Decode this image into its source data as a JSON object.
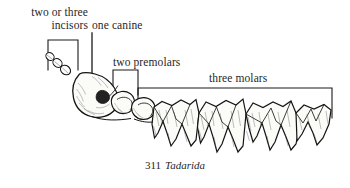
{
  "figure": {
    "caption_number": "311",
    "caption_species": "Tadarida",
    "background_color": "#ffffff",
    "ink_color": "#1a1a1a"
  },
  "labels": {
    "incisors": "two or three incisors",
    "incisors_line1": "two or three",
    "incisors_line2": "incisors",
    "canine": "one canine",
    "premolars": "two premolars",
    "molars": "three molars"
  },
  "brackets": [
    {
      "name": "incisors-bracket",
      "type": "u-bracket",
      "x1": 48,
      "x2": 78,
      "top_y": 40,
      "leg_bottom_y": 70
    },
    {
      "name": "canine-leader",
      "type": "vertical-line",
      "x": 92,
      "top_y": 33,
      "bottom_y": 78
    },
    {
      "name": "premolars-bracket",
      "type": "u-bracket",
      "x1": 113,
      "x2": 138,
      "top_y": 70,
      "leg_bottom_y": 95
    },
    {
      "name": "molars-bracket",
      "type": "u-bracket",
      "x1": 138,
      "x2": 332,
      "top_y": 88,
      "leg_bottom_y": 118
    }
  ],
  "teeth": {
    "incisors_count": 3,
    "canine_count": 1,
    "premolars_count": 2,
    "molars_count": 3,
    "description": "lateral view of upper tooth row of a free-tailed bat"
  }
}
